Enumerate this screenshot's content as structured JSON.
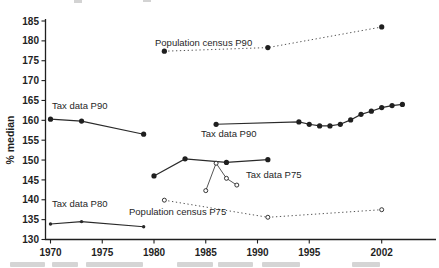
{
  "figure": {
    "background": "#ffffff",
    "ink_color": "#1f1f1f",
    "axis_color": "#1f1f1f"
  },
  "chart_data": {
    "type": "line",
    "title": "",
    "xlabel": "",
    "ylabel": "% median",
    "ylim": [
      130,
      185
    ],
    "yticks": [
      130,
      135,
      140,
      145,
      150,
      155,
      160,
      165,
      170,
      175,
      180,
      185
    ],
    "xticks": [
      1970,
      1975,
      1980,
      1985,
      1990,
      1995,
      2002
    ],
    "grid": false,
    "legend_position": "none (inline annotations)",
    "series": [
      {
        "name": "Tax data P90 (early segment)",
        "label": "Tax data P90",
        "marker": "filled",
        "line": "solid",
        "x": [
          1970,
          1973,
          1979
        ],
        "y": [
          160.3,
          159.8,
          156.5
        ]
      },
      {
        "name": "Tax data P90 (late segment)",
        "label": "Tax data P90",
        "marker": "filled",
        "line": "solid",
        "x": [
          1986,
          1994,
          1995,
          1996,
          1997,
          1998,
          1999,
          2000,
          2001,
          2002,
          2003,
          2004
        ],
        "y": [
          159.0,
          159.6,
          159.0,
          158.6,
          158.6,
          159.0,
          160.1,
          161.5,
          162.3,
          163.2,
          163.7,
          164.0
        ]
      },
      {
        "name": "Population census P90",
        "label": "Population census P90",
        "marker": "filled",
        "line": "dotted",
        "x": [
          1981,
          1991,
          2002
        ],
        "y": [
          177.4,
          178.3,
          183.5
        ]
      },
      {
        "name": "Tax data P75",
        "label": "Tax data P75",
        "marker": "filled",
        "line": "solid",
        "x": [
          1980,
          1983,
          1987,
          1991
        ],
        "y": [
          146.0,
          150.3,
          149.4,
          150.1
        ]
      },
      {
        "name": "unlabeled open-marker series near Tax data P75",
        "label": "",
        "marker": "open",
        "line": "solid-thin",
        "x": [
          1985,
          1986,
          1987,
          1988
        ],
        "y": [
          142.3,
          149.2,
          145.4,
          143.7
        ]
      },
      {
        "name": "Population census P75",
        "label": "Population census P75",
        "marker": "open",
        "line": "dotted",
        "x": [
          1981,
          1991,
          2002
        ],
        "y": [
          139.9,
          135.6,
          137.5
        ]
      },
      {
        "name": "Tax data P80",
        "label": "Tax data P80",
        "marker": "dot",
        "line": "solid",
        "x": [
          1970,
          1973,
          1979
        ],
        "y": [
          133.9,
          134.5,
          133.2
        ]
      }
    ],
    "annotations": [
      {
        "text": "Tax data P90",
        "x_px": 52,
        "y_px": 101
      },
      {
        "text": "Population census P90",
        "x_px": 155,
        "y_px": 38
      },
      {
        "text": "Tax data P90",
        "x_px": 201,
        "y_px": 129
      },
      {
        "text": "Tax data P75",
        "x_px": 246,
        "y_px": 170
      },
      {
        "text": "Tax data P80",
        "x_px": 52,
        "y_px": 199
      },
      {
        "text": "Population census P75",
        "x_px": 129,
        "y_px": 207
      }
    ]
  }
}
